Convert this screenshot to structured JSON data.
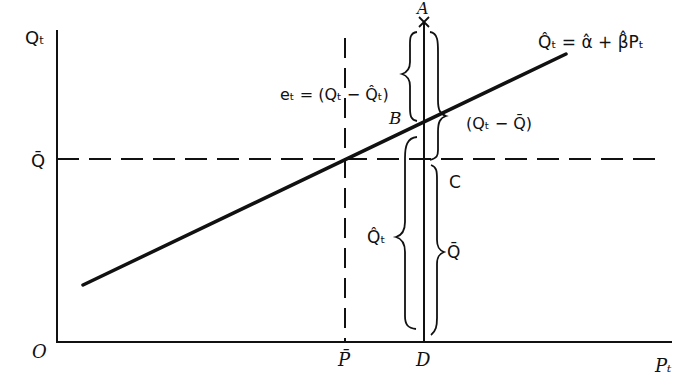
{
  "diagram": {
    "axes": {
      "y_label": "Qₜ",
      "x_label": "Pₜ",
      "origin_label": "O"
    },
    "reference_lines": {
      "mean_q_label": "Q̄",
      "mean_p_label": "P̄",
      "d_label": "D"
    },
    "regression_line": {
      "equation": "Q̂ₜ = α̂ + β̂Pₜ"
    },
    "points": {
      "A": "A",
      "B": "B",
      "C": "C"
    },
    "braces": {
      "residual": "eₜ = (Qₜ − Q̂ₜ)",
      "total_deviation": "(Qₜ − Q̄)",
      "fitted": "Q̂ₜ",
      "mean": "Q̄"
    },
    "colors": {
      "ink": "#111111",
      "background": "#ffffff"
    }
  }
}
